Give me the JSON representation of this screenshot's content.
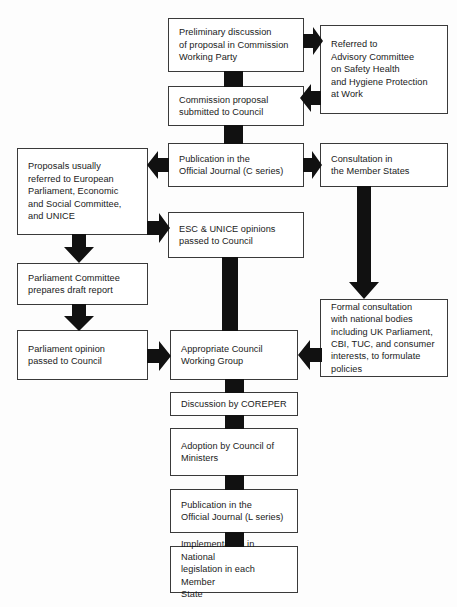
{
  "diagram": {
    "line_color": "#3a3a3a",
    "arrow_color": "#111111",
    "background": "#fdfdfd"
  },
  "nodes": {
    "preliminary_discussion": "Preliminary discussion\nof proposal in Commission\nWorking Party",
    "referred_advisory": "Referred to\nAdvisory Committee\non Safety Health\nand Hygiene Protection\nat Work",
    "commission_proposal": "Commission proposal\nsubmitted to Council",
    "publication_c_series": "Publication in the\nOfficial Journal (C series)",
    "consultation_member_states": "Consultation in\nthe Member States",
    "proposals_referred": "Proposals usually\nreferred to European\nParliament, Economic\nand Social Committee,\nand UNICE",
    "esc_unice_opinions": "ESC & UNICE opinions\npassed to Council",
    "parliament_committee": "Parliament Committee\nprepares draft report",
    "formal_consultation": "Formal consultation\nwith national bodies\nincluding UK Parliament,\nCBI, TUC, and consumer\ninterests, to formulate\npolicies",
    "parliament_opinion": "Parliament opinion\npassed to Council",
    "appropriate_council_wg": "Appropriate Council\nWorking Group",
    "discussion_coreper": "Discussion by COREPER",
    "adoption_council_ministers": "Adoption by Council of\nMinisters",
    "publication_l_series": "Publication in the\nOfficial Journal (L series)",
    "implementation_national": "Implementation in National\nlegislation in each Member\nState"
  },
  "connectors": {
    "stub_1": "connector-preliminary-to-commission",
    "stub_2": "connector-commission-to-publication-c",
    "stub_3": "connector-council-wg-to-coreper",
    "stub_4": "connector-coreper-to-adoption",
    "stub_5": "connector-adoption-to-publication-l",
    "stub_6": "connector-publication-l-to-implementation",
    "arrow_right_1": "preliminary-to-referred-advisory",
    "arrow_left_1": "referred-advisory-to-commission-proposal",
    "arrow_left_2": "publication-c-to-proposals-referred",
    "arrow_right_2": "publication-c-to-consultation-member-states",
    "arrow_right_3": "proposals-referred-to-esc-unice",
    "arrow_down_1": "proposals-referred-to-parliament-committee",
    "arrow_down_2": "parliament-committee-to-parliament-opinion",
    "arrow_right_4": "parliament-opinion-to-council-wg",
    "arrow_down_3": "esc-unice-to-council-wg",
    "arrow_down_4": "consultation-member-states-to-formal-consultation",
    "arrow_left_3": "formal-consultation-to-council-wg"
  }
}
